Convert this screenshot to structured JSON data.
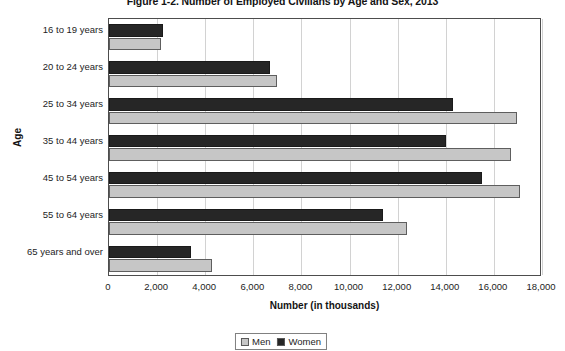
{
  "chart_data": {
    "type": "bar",
    "orientation": "horizontal",
    "title": "Figure 1-2. Number of Employed Civilians by Age and Sex, 2013",
    "xlabel": "Number (in thousands)",
    "ylabel": "Age",
    "categories": [
      "16 to 19 years",
      "20 to 24 years",
      "25 to 34 years",
      "35 to 44 years",
      "45 to 54 years",
      "55 to 64 years",
      "65 years and over"
    ],
    "series": [
      {
        "name": "Men",
        "color": "#c6c6c6",
        "values": [
          2150,
          7000,
          16950,
          16700,
          17100,
          12400,
          4300
        ]
      },
      {
        "name": "Women",
        "color": "#262626",
        "values": [
          2250,
          6700,
          14300,
          14000,
          15500,
          11400,
          3400
        ]
      }
    ],
    "xlim": [
      0,
      18000
    ],
    "xticks": [
      0,
      2000,
      4000,
      6000,
      8000,
      10000,
      12000,
      14000,
      16000,
      18000
    ],
    "xtick_labels": [
      "0",
      "2,000",
      "4,000",
      "6,000",
      "8,000",
      "10,000",
      "12,000",
      "14,000",
      "16,000",
      "18,000"
    ],
    "grid": "vertical",
    "legend_position": "bottom"
  },
  "legend": {
    "entries": [
      {
        "label": "Men"
      },
      {
        "label": "Women"
      }
    ]
  }
}
